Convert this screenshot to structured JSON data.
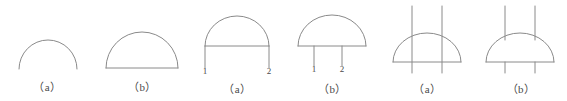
{
  "page": {
    "background_color": "#ffffff",
    "stroke_color": "#8a8a8a",
    "text_color": "#4a4a4a",
    "stroke_width": 1,
    "width": 567,
    "height": 101
  },
  "figures": [
    {
      "id": "arc-open",
      "caption": "（a）",
      "caption_text": "(a)",
      "description": "open arc, no baseline",
      "node_labels": []
    },
    {
      "id": "semicircle-closed",
      "caption": "（b）",
      "caption_text": "(b)",
      "description": "semicircle closed with baseline",
      "node_labels": []
    },
    {
      "id": "dome-chord-legs",
      "caption": "（a）",
      "caption_text": "(a)",
      "description": "tall dome with chord and two outer legs",
      "node_labels": [
        "1",
        "2"
      ]
    },
    {
      "id": "dome-inner-legs",
      "caption": "（b）",
      "caption_text": "(b)",
      "description": "dome with baseline and two inner legs",
      "node_labels": [
        "1",
        "2"
      ]
    },
    {
      "id": "dome-through-lines",
      "caption": "（a）",
      "caption_text": "(a)",
      "description": "semicircle crossed by two full vertical lines",
      "node_labels": []
    },
    {
      "id": "dome-broken-lines",
      "caption": "（b）",
      "caption_text": "(b)",
      "description": "semicircle with vertical lines interrupted by dome",
      "node_labels": []
    }
  ]
}
